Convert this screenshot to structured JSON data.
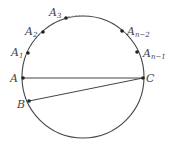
{
  "diagram": {
    "type": "circle with inscribed points and chords",
    "stroke_color": "#444444",
    "circle": {
      "cx": 83,
      "cy": 77,
      "r": 61
    },
    "points": [
      {
        "id": "A",
        "label": "A",
        "sub": "",
        "x": 23,
        "y": 78
      },
      {
        "id": "B",
        "label": "B",
        "sub": "",
        "x": 29,
        "y": 101
      },
      {
        "id": "C",
        "label": "C",
        "sub": "",
        "x": 143,
        "y": 78
      },
      {
        "id": "A1",
        "label": "A",
        "sub": "1",
        "x": 28,
        "y": 53
      },
      {
        "id": "A2",
        "label": "A",
        "sub": "2",
        "x": 43,
        "y": 32
      },
      {
        "id": "A3",
        "label": "A",
        "sub": "3",
        "x": 66,
        "y": 18
      },
      {
        "id": "An2",
        "label": "A",
        "sub": "n−2",
        "x": 122,
        "y": 31
      },
      {
        "id": "An1",
        "label": "A",
        "sub": "n−1",
        "x": 137,
        "y": 52
      }
    ],
    "segments": [
      {
        "from": "A",
        "to": "C",
        "style": "solid"
      },
      {
        "from": "B",
        "to": "C",
        "style": "solid"
      }
    ],
    "labels": {
      "A": "A",
      "B": "B",
      "C": "C",
      "A1": "A",
      "A1_sub": "1",
      "A2": "A",
      "A2_sub": "2",
      "A3": "A",
      "A3_sub": "3",
      "An2": "A",
      "An2_sub": "n−2",
      "An1": "A",
      "An1_sub": "n−1"
    }
  }
}
